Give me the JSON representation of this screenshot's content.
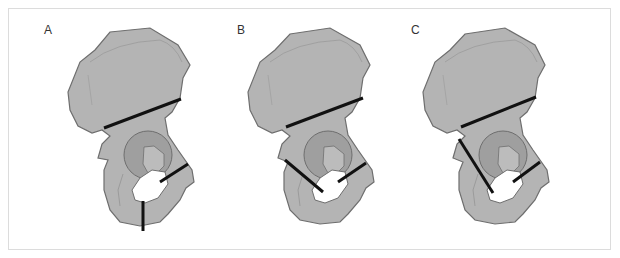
{
  "figure": {
    "colors": {
      "bone_fill": "#b4b4b4",
      "bone_outline": "#6e6e6e",
      "socket_rim": "#9a9a9a",
      "socket_inner": "#bcbcbc",
      "cut_line": "#111111",
      "frame_border": "#dcdcdc"
    },
    "panels": [
      {
        "label": "A",
        "lines": [
          "ilium transverse",
          "superior pubic ramus",
          "inferior ischial ramus (vertical)"
        ]
      },
      {
        "label": "B",
        "lines": [
          "ilium transverse",
          "superior pubic ramus",
          "ischium oblique"
        ]
      },
      {
        "label": "C",
        "lines": [
          "ilium transverse",
          "superior pubic ramus",
          "posterior column long oblique"
        ]
      }
    ]
  }
}
